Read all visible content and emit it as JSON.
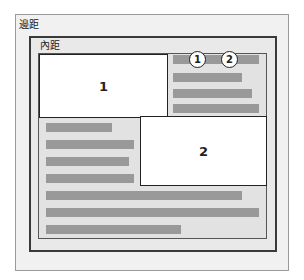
{
  "labels": {
    "margin": "邊距",
    "padding": "內距"
  },
  "floats": [
    {
      "label": "1"
    },
    {
      "label": "2"
    }
  ],
  "callouts": [
    {
      "label": "1"
    },
    {
      "label": "2"
    }
  ],
  "colors": {
    "text_bar": "#999999",
    "float_bg": "#ffffff",
    "margin_bg": "#f1f1f1",
    "padding_bg": "#e2e2e2",
    "border": "#3a3a3a"
  }
}
